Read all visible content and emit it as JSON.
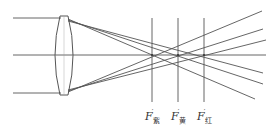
{
  "diagram": {
    "type": "chromatic-aberration-lens",
    "labels": [
      {
        "base": "F",
        "prime": "′",
        "sub": "紫",
        "x": 145,
        "y": 110
      },
      {
        "base": "F",
        "prime": "′",
        "sub": "黄",
        "x": 171,
        "y": 110
      },
      {
        "base": "F",
        "prime": "′",
        "sub": "红",
        "x": 197,
        "y": 110
      }
    ],
    "focal_points_x": [
      152,
      178,
      204
    ],
    "colors": {
      "line": "#555555",
      "background": "#ffffff"
    }
  }
}
